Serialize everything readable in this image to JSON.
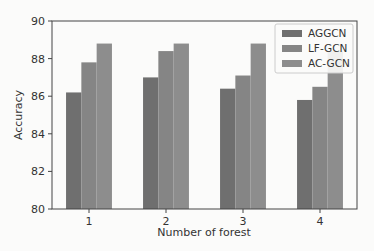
{
  "chart_data": {
    "type": "bar",
    "title": "",
    "xlabel": "Number of forest",
    "ylabel": "Accuracy",
    "categories": [
      "1",
      "2",
      "3",
      "4"
    ],
    "ylim": [
      80,
      90
    ],
    "yticks": [
      "80",
      "82",
      "84",
      "86",
      "88",
      "90"
    ],
    "grid": false,
    "legend_position": "top-right",
    "series": [
      {
        "name": "AGGCN",
        "color": "#6f6f6f",
        "values": [
          86.2,
          87.0,
          86.4,
          85.8
        ]
      },
      {
        "name": "LF-GCN",
        "color": "#858585",
        "values": [
          87.8,
          88.4,
          87.1,
          86.5
        ]
      },
      {
        "name": "AC-GCN",
        "color": "#8d8d8d",
        "values": [
          88.8,
          88.8,
          88.8,
          88.4
        ]
      }
    ]
  }
}
